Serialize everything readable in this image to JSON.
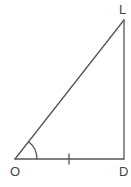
{
  "diagram": {
    "type": "right-triangle",
    "stroke_color": "#555555",
    "vertices": [
      {
        "label": "O",
        "role": "angle-vertex"
      },
      {
        "label": "D",
        "role": "right-angle-vertex"
      },
      {
        "label": "L",
        "role": "top-vertex"
      }
    ],
    "sides": [
      {
        "from": "O",
        "to": "D",
        "marked": true,
        "mark": "single-tick"
      },
      {
        "from": "D",
        "to": "L",
        "marked": false
      },
      {
        "from": "O",
        "to": "L",
        "marked": false
      }
    ],
    "angle_mark": {
      "at": "O",
      "type": "arc"
    }
  }
}
